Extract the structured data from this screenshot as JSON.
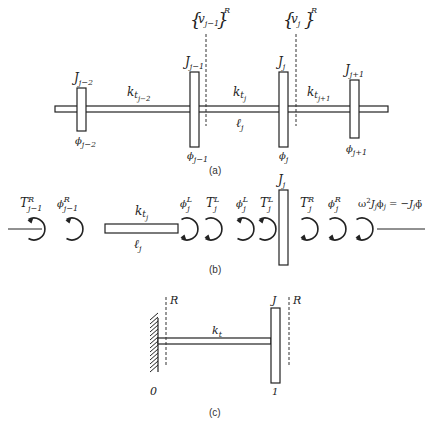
{
  "figure": {
    "panel_a": {
      "label": "(a)",
      "disks": [
        {
          "inertia": "J",
          "inertia_sub": "j−2",
          "angle": "ϕ",
          "angle_sub": "j−2"
        },
        {
          "inertia": "J",
          "inertia_sub": "j−1",
          "angle": "ϕ",
          "angle_sub": "j−1"
        },
        {
          "inertia": "J",
          "inertia_sub": "j",
          "angle": "ϕ",
          "angle_sub": "j"
        },
        {
          "inertia": "J",
          "inertia_sub": "j+1",
          "angle": "ϕ",
          "angle_sub": "j+1"
        }
      ],
      "shafts": [
        {
          "stiffness": "k",
          "stiffness_sub": "t",
          "stiffness_subsub": "j−2"
        },
        {
          "stiffness": "k",
          "stiffness_sub": "t",
          "stiffness_subsub": "j",
          "length": "ℓ",
          "length_sub": "j"
        },
        {
          "stiffness": "k",
          "stiffness_sub": "t",
          "stiffness_subsub": "j+1"
        }
      ],
      "state_vectors": [
        {
          "open": "{",
          "symbol": "v",
          "sub": "j−1",
          "close": "}",
          "sup": "R"
        },
        {
          "open": "{",
          "symbol": "v",
          "sub": "j",
          "close": "}",
          "sup": "R"
        }
      ]
    },
    "panel_b": {
      "label": "(b)",
      "items": [
        {
          "symbol": "T",
          "sup": "R",
          "sub": "j−1"
        },
        {
          "symbol": "ϕ",
          "sup": "R",
          "sub": "j−1"
        },
        {
          "symbol": "ϕ",
          "sup": "L",
          "sub": "j"
        },
        {
          "symbol": "T",
          "sup": "L",
          "sub": "j"
        },
        {
          "symbol": "ϕ",
          "sup": "L",
          "sub": "j"
        },
        {
          "symbol": "T",
          "sup": "L",
          "sub": "j"
        },
        {
          "symbol": "T",
          "sup": "R",
          "sub": "j"
        },
        {
          "symbol": "ϕ",
          "sup": "R",
          "sub": "j"
        }
      ],
      "shaft": {
        "stiffness": "k",
        "stiffness_sub": "t",
        "stiffness_subsub": "j",
        "length": "ℓ",
        "length_sub": "j"
      },
      "disk": {
        "inertia": "J",
        "inertia_sub": "j"
      },
      "inertia_torque": {
        "w": "ω",
        "w_sup": "2",
        "J": "J",
        "J_sub": "j",
        "phi": "ϕ",
        "phi_sub": "j",
        "eq": " = −",
        "J2": "J",
        "J2_sub": "j",
        "phiddot": "ϕ̈"
      }
    },
    "panel_c": {
      "label": "(c)",
      "station_left": "0",
      "station_right": "1",
      "disk_label": "J",
      "shaft_label": "k",
      "shaft_label_sub": "t",
      "section_left": "R",
      "section_right": "R"
    }
  }
}
